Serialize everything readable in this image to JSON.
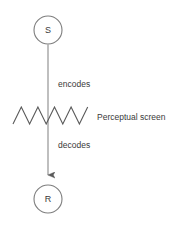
{
  "diagram": {
    "background_color": "#ffffff",
    "stroke_color": "#7d7d7d",
    "text_color": "#3a3a3a",
    "nodes": [
      {
        "id": "stimulus",
        "label": "S",
        "shape": "circle",
        "cx": 48,
        "cy": 30,
        "r": 14
      },
      {
        "id": "response",
        "label": "R",
        "shape": "circle",
        "cx": 48,
        "cy": 199,
        "r": 14
      }
    ],
    "edges": [
      {
        "id": "encodes-edge",
        "label": "encodes",
        "from": "stimulus",
        "to": "perceptual-screen",
        "label_x": 58,
        "label_y": 85,
        "arrowhead": false
      },
      {
        "id": "decodes-edge",
        "label": "decodes",
        "from": "perceptual-screen",
        "to": "response",
        "label_x": 58,
        "label_y": 146,
        "arrowhead": true
      }
    ],
    "screen": {
      "id": "perceptual-screen",
      "label": "Perceptual screen",
      "label_x": 97,
      "label_y": 118,
      "zigzag": {
        "x_start": 13,
        "x_end": 88,
        "y_top": 107,
        "y_bottom": 124,
        "peaks": 5
      }
    }
  }
}
